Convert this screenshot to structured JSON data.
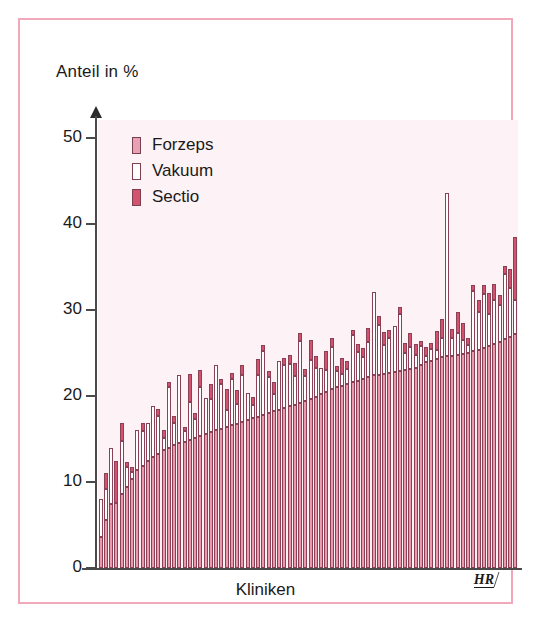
{
  "axis": {
    "y_title": "Anteil in %",
    "x_title": "Kliniken",
    "y_ticks": [
      "50",
      "40",
      "30",
      "20",
      "10",
      "0"
    ]
  },
  "legend": {
    "items": [
      {
        "label": "Forzeps",
        "color": "#e8a0b4"
      },
      {
        "label": "Vakuum",
        "color": "#ffffff"
      },
      {
        "label": "Sectio",
        "color": "#d4526e"
      }
    ]
  },
  "credit": {
    "text": "HR"
  },
  "colors": {
    "frame": "#f2a8bb",
    "plot_bg": "#fdf2f5",
    "sectio": "#eb9aad",
    "vakuum": "#ffffff",
    "forzeps": "#d4526e",
    "outline": "#8a4055"
  },
  "chart_data": {
    "type": "bar",
    "stacked": true,
    "title": "",
    "subtitle": "",
    "xlabel": "Kliniken",
    "ylabel": "Anteil in %",
    "ylim": [
      0,
      52
    ],
    "yticks": [
      0,
      10,
      20,
      30,
      40,
      50
    ],
    "grid": false,
    "legend_position": "top-left",
    "categories_note": "80 unlabelled clinics, sorted by ascending Sectio rate",
    "series": [
      {
        "name": "Sectio",
        "color": "#eb9aad",
        "values": [
          3.6,
          5.6,
          7.5,
          7.6,
          8.6,
          9.4,
          10.4,
          11.4,
          11.9,
          12.4,
          12.9,
          13.3,
          13.7,
          14.0,
          14.3,
          14.5,
          14.7,
          14.9,
          15.1,
          15.3,
          15.6,
          15.8,
          16.0,
          16.2,
          16.4,
          16.6,
          16.8,
          17.0,
          17.2,
          17.4,
          17.6,
          17.8,
          18.0,
          18.2,
          18.4,
          18.6,
          18.8,
          19.0,
          19.2,
          19.4,
          19.6,
          19.9,
          20.2,
          20.5,
          20.8,
          21.0,
          21.2,
          21.4,
          21.6,
          21.8,
          22.0,
          22.2,
          22.4,
          22.5,
          22.6,
          22.7,
          22.8,
          22.9,
          23.0,
          23.1,
          23.3,
          23.6,
          23.9,
          24.1,
          24.3,
          24.5,
          24.6,
          24.7,
          24.8,
          24.9,
          25.0,
          25.2,
          25.4,
          25.6,
          25.8,
          26.0,
          26.3,
          26.6,
          26.9,
          27.2
        ]
      },
      {
        "name": "Vakuum",
        "color": "#ffffff",
        "values": [
          4.4,
          3.6,
          6.4,
          0.0,
          6.2,
          2.3,
          0.8,
          4.6,
          4.0,
          4.5,
          5.9,
          4.4,
          1.4,
          7.0,
          2.6,
          8.0,
          1.2,
          4.4,
          2.2,
          5.7,
          4.2,
          3.8,
          7.6,
          5.2,
          2.0,
          5.4,
          2.3,
          5.5,
          3.2,
          1.6,
          4.9,
          7.4,
          4.2,
          2.0,
          5.7,
          5.0,
          4.9,
          3.3,
          7.2,
          2.9,
          4.6,
          3.4,
          3.0,
          2.5,
          4.9,
          1.9,
          1.4,
          1.7,
          5.5,
          3.3,
          2.5,
          4.1,
          9.7,
          5.8,
          3.3,
          4.1,
          5.3,
          6.6,
          2.0,
          2.6,
          1.5,
          2.2,
          0.8,
          1.4,
          1.0,
          2.3,
          19.0,
          2.0,
          2.5,
          1.6,
          0.9,
          7.0,
          4.4,
          6.3,
          3.7,
          5.2,
          4.3,
          7.6,
          5.7,
          4.0
        ]
      },
      {
        "name": "Forzeps",
        "color": "#d4526e",
        "values": [
          0.0,
          1.8,
          0.0,
          4.8,
          2.1,
          0.6,
          0.5,
          0.0,
          1.0,
          0.0,
          0.0,
          0.8,
          0.9,
          0.6,
          0.8,
          0.0,
          0.5,
          3.3,
          0.7,
          2.0,
          0.0,
          1.8,
          0.0,
          0.6,
          2.4,
          0.7,
          1.6,
          1.1,
          0.0,
          0.9,
          1.8,
          0.7,
          0.7,
          1.4,
          0.0,
          0.8,
          1.1,
          1.5,
          0.9,
          0.8,
          2.3,
          1.4,
          0.0,
          2.2,
          1.0,
          0.6,
          1.8,
          1.0,
          0.6,
          1.0,
          1.1,
          1.6,
          0.0,
          1.0,
          1.6,
          0.9,
          0.0,
          0.8,
          1.2,
          1.6,
          1.3,
          0.6,
          1.0,
          0.7,
          2.3,
          2.1,
          0.0,
          1.1,
          2.5,
          2.0,
          0.8,
          0.7,
          1.4,
          1.0,
          2.5,
          1.8,
          1.2,
          0.9,
          2.2,
          7.3
        ]
      }
    ]
  }
}
